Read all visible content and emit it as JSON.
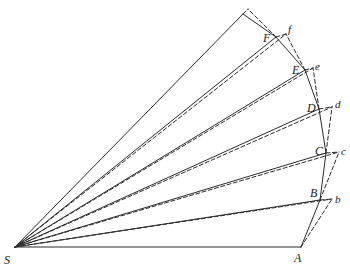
{
  "diagram": {
    "colors": {
      "line": "#2a2a2a",
      "background": "#ffffff"
    },
    "center": {
      "label": "S",
      "x": 15,
      "y": 247
    },
    "solid_points": [
      {
        "label": "A",
        "x": 301,
        "y": 247
      },
      {
        "label": "B",
        "x": 320,
        "y": 200
      },
      {
        "label": "C",
        "x": 326,
        "y": 153
      },
      {
        "label": "D",
        "x": 319,
        "y": 109
      },
      {
        "label": "E",
        "x": 305,
        "y": 70
      },
      {
        "label": "F",
        "x": 276,
        "y": 37
      },
      {
        "label": "",
        "x": 243,
        "y": 14
      }
    ],
    "dashed_points": [
      {
        "label": "b",
        "x": 332,
        "y": 199
      },
      {
        "label": "c",
        "x": 339,
        "y": 152
      },
      {
        "label": "d",
        "x": 332,
        "y": 107
      },
      {
        "label": "e",
        "x": 313,
        "y": 68
      },
      {
        "label": "f",
        "x": 286,
        "y": 34
      },
      {
        "label": "",
        "x": 248,
        "y": 9
      }
    ],
    "labels": {
      "S": "S",
      "A": "A",
      "B": "B",
      "C": "C",
      "D": "D",
      "E": "E",
      "F": "F",
      "b": "b",
      "c": "c",
      "d": "d",
      "e": "e",
      "f": "f"
    }
  }
}
